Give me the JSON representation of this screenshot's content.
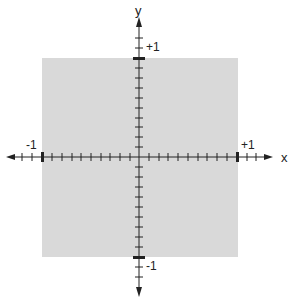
{
  "diagram": {
    "axes": {
      "x_label": "x",
      "y_label": "y",
      "x_min_label": "-1",
      "x_max_label": "+1",
      "y_max_label": "+1",
      "y_min_label": "-1"
    },
    "region": {
      "shape": "square",
      "x_range": [
        -1,
        1
      ],
      "y_range": [
        -1,
        1
      ],
      "fill_color": "#d9d9d9"
    },
    "ticks_per_unit": 10,
    "colors": {
      "axis": "#222222",
      "background": "#ffffff"
    }
  }
}
